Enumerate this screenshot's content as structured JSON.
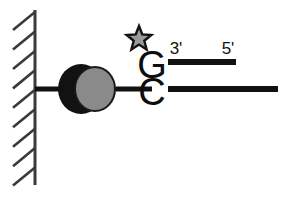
{
  "figure": {
    "title": "Surface-tethered DNA duplex with labeled terminus",
    "background_color": "#ffffff",
    "ink_color": "#111111"
  },
  "wall": {
    "name": "hatched wall / solid support",
    "line_color": "#3a3a3a",
    "hatch_count": 9,
    "hatch_color": "#3a3a3a",
    "x": 35,
    "y_top": 10,
    "y_bottom": 185
  },
  "tether": {
    "name": "tether linker line",
    "color": "#111111",
    "x_start": 35,
    "x_end": 152,
    "y": 89,
    "thickness": 5
  },
  "particle": {
    "name": "bead / protein complex",
    "back_color": "#121212",
    "front_color": "#8a8a8a",
    "front_outline_color": "#1a1a1a",
    "back_center": [
      81,
      89
    ],
    "front_center": [
      95,
      89
    ]
  },
  "star": {
    "name": "fluorescent label star",
    "fill_color": "#9a9a9a",
    "outline_color": "#121212",
    "center": [
      139,
      39
    ],
    "outer_radius": 13,
    "inner_radius": 5.6
  },
  "bases": {
    "top": {
      "letter": "G",
      "x": 152,
      "baseline_y": 78
    },
    "bottom": {
      "letter": "C",
      "x": 152,
      "baseline_y": 105
    }
  },
  "labels": {
    "three_prime": {
      "text": "3'",
      "x": 176,
      "baseline_y": 54
    },
    "five_prime": {
      "text": "5'",
      "x": 228,
      "baseline_y": 54
    }
  },
  "strands": {
    "top": {
      "name": "top strand (short, 3' to 5')",
      "color": "#111111",
      "x_start": 168,
      "x_end": 236,
      "y": 62,
      "thickness": 6
    },
    "bottom": {
      "name": "bottom strand (long, tethered)",
      "color": "#111111",
      "x_start": 168,
      "x_end": 278,
      "y": 89,
      "thickness": 6
    }
  }
}
